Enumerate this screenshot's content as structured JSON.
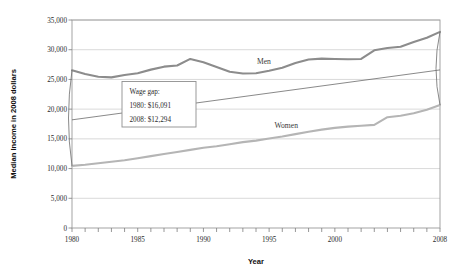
{
  "chart_data": {
    "type": "line",
    "title": "",
    "xlabel": "Year",
    "ylabel": "Median Income in 2008 dollars",
    "xlim": [
      1980,
      2008
    ],
    "ylim": [
      0,
      35000
    ],
    "grid": true,
    "legend_position": "inline-labels",
    "y_ticks": [
      0,
      5000,
      10000,
      15000,
      20000,
      25000,
      30000,
      35000
    ],
    "y_tick_labels": [
      "0",
      "5,000",
      "10,000",
      "15,000",
      "20,000",
      "25,000",
      "30,000",
      "35,000"
    ],
    "x_ticks": [
      1980,
      1981,
      1982,
      1983,
      1984,
      1985,
      1986,
      1987,
      1988,
      1989,
      1990,
      1991,
      1992,
      1993,
      1994,
      1995,
      1996,
      1997,
      1998,
      1999,
      2000,
      2001,
      2002,
      2003,
      2004,
      2005,
      2006,
      2007,
      2008
    ],
    "x_tick_labels_shown": [
      "1980",
      "1985",
      "1990",
      "1995",
      "2000",
      "2008"
    ],
    "x_tick_label_values": [
      1980,
      1985,
      1990,
      1995,
      2000,
      2008
    ],
    "x": [
      1980,
      1981,
      1982,
      1983,
      1984,
      1985,
      1986,
      1987,
      1988,
      1989,
      1990,
      1991,
      1992,
      1993,
      1994,
      1995,
      1996,
      1997,
      1998,
      1999,
      2000,
      2001,
      2002,
      2003,
      2004,
      2005,
      2006,
      2007,
      2008
    ],
    "series": [
      {
        "name": "Men",
        "color": "#8c8c8c",
        "label": "Men",
        "label_x": 1994.6,
        "label_y": 27600,
        "values": [
          26550,
          25900,
          25450,
          25350,
          25750,
          26050,
          26650,
          27150,
          27350,
          28450,
          27900,
          27100,
          26300,
          26000,
          26050,
          26450,
          26950,
          27750,
          28350,
          28500,
          28450,
          28400,
          28450,
          29900,
          30300,
          30500,
          31300,
          32000,
          33000
        ]
      },
      {
        "name": "Women",
        "color": "#b5b5b5",
        "label": "Women",
        "label_x": 1996.3,
        "label_y": 16900,
        "values": [
          10459,
          10650,
          10900,
          11150,
          11400,
          11750,
          12100,
          12450,
          12800,
          13150,
          13500,
          13750,
          14100,
          14450,
          14700,
          15050,
          15400,
          15800,
          16200,
          16550,
          16850,
          17050,
          17200,
          17350,
          18650,
          18900,
          19300,
          19900,
          20706
        ]
      }
    ],
    "gap_line": {
      "name": "wage-gap-trend",
      "color": "#6b6b6b",
      "start": {
        "x": 1980,
        "y": 18200
      },
      "end": {
        "x": 2008,
        "y": 26600
      }
    },
    "annotation": {
      "title": "Wage gap:",
      "line1": "1980: $16,091",
      "line2": "2008: $12,294"
    }
  }
}
